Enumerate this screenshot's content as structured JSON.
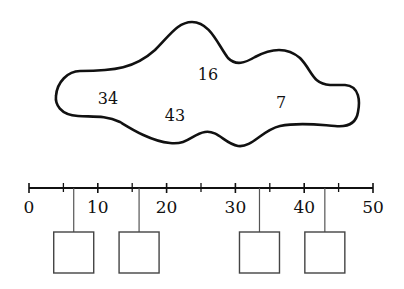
{
  "cloud": {
    "numbers": [
      {
        "label": "34",
        "x": 108,
        "y": 104
      },
      {
        "label": "16",
        "x": 208,
        "y": 80
      },
      {
        "label": "43",
        "x": 175,
        "y": 121
      },
      {
        "label": "7",
        "x": 281,
        "y": 108
      }
    ]
  },
  "number_line": {
    "min": 0,
    "max": 50,
    "major_ticks": [
      "0",
      "10",
      "20",
      "30",
      "40",
      "50"
    ],
    "minor_step": 5,
    "x0": 29,
    "x1": 373,
    "y": 188
  },
  "boxes": [
    {
      "position": 6.5,
      "value": ""
    },
    {
      "position": 16,
      "value": ""
    },
    {
      "position": 33.5,
      "value": ""
    },
    {
      "position": 43,
      "value": ""
    }
  ],
  "colors": {
    "stroke": "#111111",
    "box_stroke": "#444444",
    "background": "#ffffff"
  }
}
